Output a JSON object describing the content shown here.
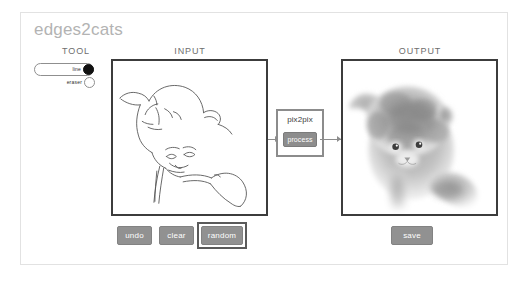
{
  "app": {
    "title": "edges2cats"
  },
  "headings": {
    "tool": "TOOL",
    "input": "INPUT",
    "output": "OUTPUT"
  },
  "tool_selector": {
    "options": [
      {
        "label": "line",
        "selected": true,
        "name": "tool-option-line"
      },
      {
        "label": "eraser",
        "selected": false,
        "name": "tool-option-eraser"
      }
    ]
  },
  "processor": {
    "label": "pix2pix",
    "process_label": "process"
  },
  "actions": {
    "undo": "undo",
    "clear": "clear",
    "random": "random",
    "save": "save"
  },
  "colors": {
    "title": "#b3b3b3",
    "button_fill": "#919191",
    "canvas_border": "#3c3c3c",
    "processor_border": "#8c8c8c",
    "focus_ring": "#5a5a5a",
    "frame_border": "#e2e2e2",
    "sketch_stroke": "#555555"
  }
}
